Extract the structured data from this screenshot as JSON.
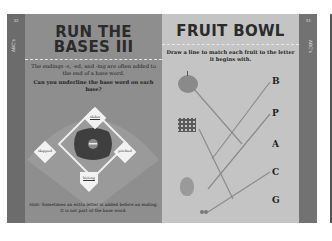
{
  "left_page": {
    "page_number": "32",
    "tab_label": "ABC's",
    "title_line1": "RUN THE",
    "title_line2": "BASES III",
    "intro": "The endings -s, -ed, and -ing are often added to the end of a base word.",
    "question": "Can you underline the base word on each base?",
    "bases": {
      "second": "slides",
      "first": "pitched",
      "third": "skipped",
      "home": "hitting"
    },
    "hint": "Hint: Sometimes an extra letter is added before an ending. It is not part of the base word."
  },
  "right_page": {
    "page_number": "33",
    "tab_label": "ABC's",
    "title": "FRUIT BOWL",
    "instructions": "Draw a line to match each fruit to the letter it begins with.",
    "fruits": [
      "apple",
      "grapes",
      "banana",
      "pear",
      "cherries"
    ],
    "letters": [
      "B",
      "P",
      "A",
      "C",
      "G"
    ]
  },
  "colors": {
    "left_page_bg": "#8e8e8e",
    "right_page_bg": "#c4c4c4",
    "tab_bg": "#6c6c6c",
    "fruit_red": "#8a8a8a",
    "line_color": "#8c8c8c"
  }
}
